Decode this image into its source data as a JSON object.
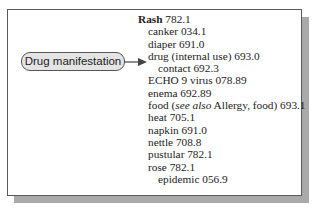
{
  "callout": {
    "label": "Drug manifestation",
    "fill_color": "#e4e4e4",
    "points_to_entry": "drug (internal use) 693.0"
  },
  "index": {
    "main_term": "Rash",
    "main_code": "782.1",
    "entries": [
      {
        "level": 1,
        "text": "canker 034.1"
      },
      {
        "level": 1,
        "text": "diaper 691.0"
      },
      {
        "level": 1,
        "text": "drug (internal use) 693.0"
      },
      {
        "level": 2,
        "text": "contact 692.3"
      },
      {
        "level": 1,
        "text": "ECHO 9 virus 078.89"
      },
      {
        "level": 1,
        "text": "enema 692.89"
      },
      {
        "level": 1,
        "pre": "food (",
        "italic": "see also",
        "post": " Allergy, food) 693.1"
      },
      {
        "level": 1,
        "text": "heat 705.1"
      },
      {
        "level": 1,
        "text": "napkin 691.0"
      },
      {
        "level": 1,
        "text": "nettle 708.8"
      },
      {
        "level": 1,
        "text": "pustular 782.1"
      },
      {
        "level": 1,
        "text": "rose 782.1"
      },
      {
        "level": 2,
        "text": "epidemic 056.9"
      }
    ]
  }
}
